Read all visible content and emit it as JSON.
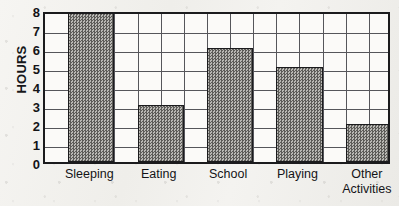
{
  "chart_data": {
    "type": "bar",
    "title": "",
    "subtitle": "",
    "xlabel": "",
    "ylabel": "HOURS",
    "categories": [
      "Sleeping",
      "Eating",
      "School",
      "Playing",
      "Other\nActivities"
    ],
    "values": [
      8,
      3,
      6,
      5,
      2
    ],
    "ylim": [
      0,
      8
    ],
    "ytick_labels": [
      "0",
      "1",
      "2",
      "3",
      "4",
      "5",
      "6",
      "7",
      "8"
    ],
    "ytick_values": [
      0,
      1,
      2,
      3,
      4,
      5,
      6,
      7,
      8
    ],
    "grid": true,
    "grid_vertical_columns": 15,
    "legend": null,
    "legend_position": "none",
    "annotations": [],
    "series": [
      {
        "name": "Hours per day",
        "values": [
          8,
          3,
          6,
          5,
          2
        ]
      }
    ],
    "bar_fill": "halftone-dot",
    "colors": {
      "bar_fill": "#b9b8b4",
      "bar_dot": "#5c5b58",
      "bar_outline": "#1b1b1d",
      "frame": "#1b1b1d",
      "grid": "#55555a",
      "plot_background": "#fbfaf8",
      "page_background": "#f3f2ef",
      "text": "#141417"
    }
  }
}
